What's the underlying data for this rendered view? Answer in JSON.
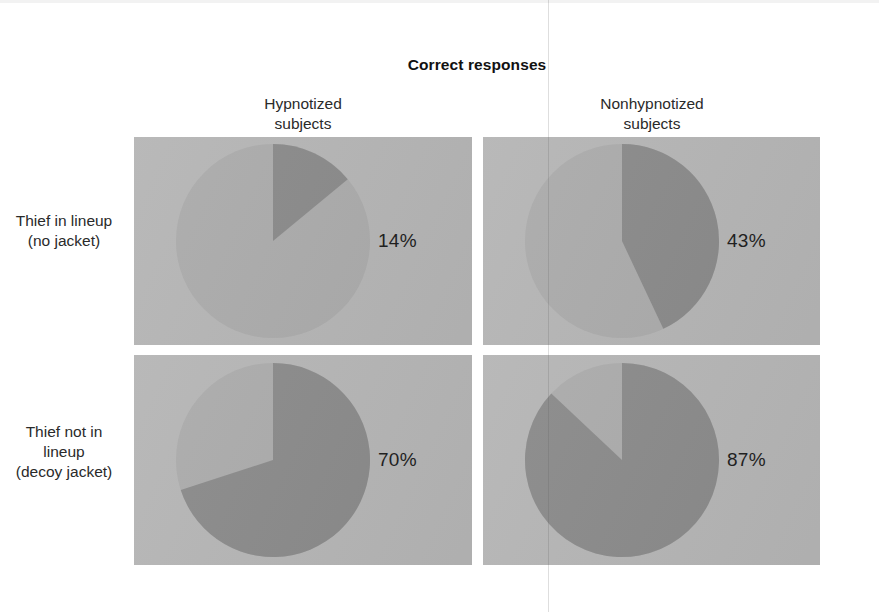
{
  "figure": {
    "title": "Correct responses",
    "background": "#ffffff",
    "panel_color": "#b5b5b5",
    "pie_remainder_color": "#ababab",
    "pie_wedge_color": "#8a8a8a",
    "text_color": "#1d1d1d"
  },
  "columns": [
    {
      "label": "Hypnotized\nsubjects",
      "line1": "Hypnotized",
      "line2": "subjects"
    },
    {
      "label": "Nonhypnotized\nsubjects",
      "line1": "Nonhypnotized",
      "line2": "subjects"
    }
  ],
  "rows": [
    {
      "line1": "Thief in lineup",
      "line2": "(no jacket)",
      "line3": ""
    },
    {
      "line1": "Thief not in",
      "line2": "lineup",
      "line3": "(decoy jacket)"
    }
  ],
  "cells": [
    {
      "row": 0,
      "col": 0,
      "percent": 14,
      "label": "14%"
    },
    {
      "row": 0,
      "col": 1,
      "percent": 43,
      "label": "43%"
    },
    {
      "row": 1,
      "col": 0,
      "percent": 70,
      "label": "70%"
    },
    {
      "row": 1,
      "col": 1,
      "percent": 87,
      "label": "87%"
    }
  ],
  "chart_data": {
    "type": "pie",
    "title": "Correct responses",
    "xlabel": "",
    "ylabel": "",
    "layout": "2x2 grid of pie charts",
    "legend": "none",
    "grid": false,
    "start_angle_deg": 0,
    "direction": "clockwise",
    "row_categories": [
      "Thief in lineup (no jacket)",
      "Thief not in lineup (decoy jacket)"
    ],
    "column_categories": [
      "Hypnotized subjects",
      "Nonhypnotized subjects"
    ],
    "series": [
      {
        "name": "Correct responses",
        "slice_color": "#8a8a8a"
      },
      {
        "name": "Other responses",
        "slice_color": "#ababab"
      }
    ],
    "panels": [
      {
        "row": "Thief in lineup (no jacket)",
        "column": "Hypnotized subjects",
        "values": [
          14,
          86
        ],
        "labels": [
          "Correct responses",
          "Other responses"
        ],
        "annotation": "14%"
      },
      {
        "row": "Thief in lineup (no jacket)",
        "column": "Nonhypnotized subjects",
        "values": [
          43,
          57
        ],
        "labels": [
          "Correct responses",
          "Other responses"
        ],
        "annotation": "43%"
      },
      {
        "row": "Thief not in lineup (decoy jacket)",
        "column": "Hypnotized subjects",
        "values": [
          70,
          30
        ],
        "labels": [
          "Correct responses",
          "Other responses"
        ],
        "annotation": "70%"
      },
      {
        "row": "Thief not in lineup (decoy jacket)",
        "column": "Nonhypnotized subjects",
        "values": [
          87,
          13
        ],
        "labels": [
          "Correct responses",
          "Other responses"
        ],
        "annotation": "87%"
      }
    ]
  }
}
